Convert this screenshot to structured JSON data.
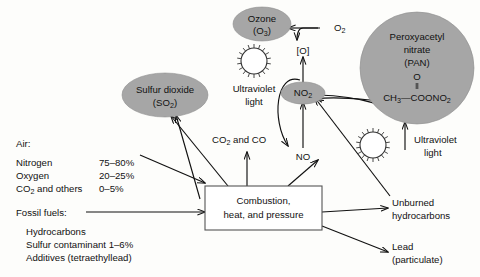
{
  "diagram": {
    "background_color": "#fdfdfb",
    "ellipse_fill": "#a6a6a6",
    "line_color": "#111111"
  },
  "central_box": {
    "line1": "Combustion,",
    "line2": "heat, and pressure"
  },
  "inputs": {
    "air_heading": "Air:",
    "air_rows": [
      {
        "name": "Nitrogen",
        "value": "75–80%"
      },
      {
        "name": "Oxygen",
        "value": "20–25%"
      },
      {
        "name": "name_sub",
        "value": "0–5%"
      }
    ],
    "air_row3_pre": "CO",
    "air_row3_sub": "2",
    "air_row3_post": " and others",
    "air_row3_value": "0–5%",
    "fuel_heading": "Fossil fuels:",
    "fuel_items": [
      "Hydrocarbons",
      "Sulfur contaminant 1–6%",
      "Additives (tetraethyllead)"
    ]
  },
  "products": {
    "sulfur_dioxide_name": "Sulfur dioxide",
    "sulfur_dioxide_formula_pre": "(SO",
    "sulfur_dioxide_formula_sub": "2",
    "sulfur_dioxide_formula_post": ")",
    "ozone_name": "Ozone",
    "ozone_formula_pre": "(O",
    "ozone_formula_sub": "3",
    "ozone_formula_post": ")",
    "pan_line1": "Peroxyacetyl",
    "pan_line2": "nitrate",
    "pan_line3": "(PAN)",
    "pan_atom_o": "O",
    "pan_formula_pre": "CH",
    "pan_formula_sub1": "3",
    "pan_formula_mid": "—COONO",
    "pan_formula_sub2": "2",
    "no2_pre": "NO",
    "no2_sub": "2",
    "no_label": "NO",
    "o2_pre": "O",
    "o2_sub": "2",
    "atomic_oxygen": "[O]",
    "co2_co_pre": "CO",
    "co2_co_sub": "2",
    "co2_co_post": " and CO",
    "unburned_line1": "Unburned",
    "unburned_line2": "hydrocarbons",
    "lead_line1": "Lead",
    "lead_line2": "(particulate)"
  },
  "uv": {
    "label_line1": "Ultraviolet",
    "label_line2": "light",
    "icon_name": "sun-icon",
    "count": 2
  }
}
